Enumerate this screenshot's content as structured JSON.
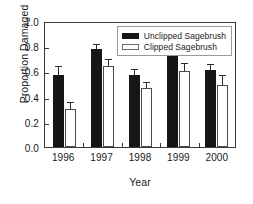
{
  "chart_data": {
    "type": "bar",
    "title": "",
    "xlabel": "Year",
    "ylabel": "Proportion Damaged",
    "categories": [
      "1996",
      "1997",
      "1998",
      "1999",
      "2000"
    ],
    "ylim": [
      0.0,
      1.0
    ],
    "yticks": [
      "0.0",
      "0.2",
      "0.4",
      "0.6",
      "0.8",
      "1.0"
    ],
    "ytick_values": [
      0.0,
      0.2,
      0.4,
      0.6,
      0.8,
      1.0
    ],
    "grid": false,
    "legend_position": "top-right inside plot frame",
    "series": [
      {
        "name": "Unclipped Sagebrush",
        "color": "#161616",
        "fill": "solid",
        "values": [
          0.57,
          0.78,
          0.57,
          0.72,
          0.61
        ],
        "errors_upper": [
          0.065,
          0.03,
          0.04,
          0.035,
          0.04
        ]
      },
      {
        "name": "Clipped Sagebrush",
        "color": "#ffffff",
        "fill": "open",
        "values": [
          0.3,
          0.64,
          0.47,
          0.6,
          0.49
        ],
        "errors_upper": [
          0.05,
          0.05,
          0.035,
          0.06,
          0.07
        ]
      }
    ]
  }
}
